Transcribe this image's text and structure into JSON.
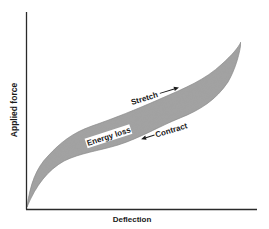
{
  "diagram": {
    "type": "hysteresis-loop",
    "x_axis": {
      "label": "Deflection"
    },
    "y_axis": {
      "label": "Applied force"
    },
    "annotations": {
      "stretch": "Stretch",
      "contract": "Contract",
      "energy_loss": "Energy loss"
    },
    "colors": {
      "axis": "#2a2a2a",
      "loop_fill": "#9a9a9a",
      "loop_edge": "#6e6e6e",
      "text": "#1a1a1a",
      "background": "#ffffff"
    }
  }
}
